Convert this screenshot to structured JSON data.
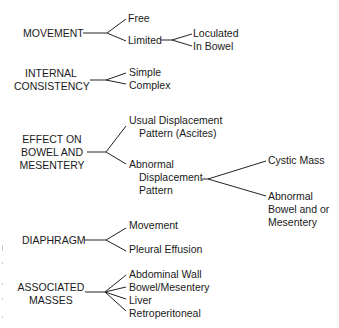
{
  "diagram": {
    "categories": [
      {
        "label": "MOVEMENT",
        "branches": [
          {
            "label": "Free"
          },
          {
            "label": "Limited",
            "branches": [
              {
                "label": "Loculated"
              },
              {
                "label": "In Bowel"
              }
            ]
          }
        ]
      },
      {
        "label_lines": [
          "INTERNAL",
          "CONSISTENCY"
        ],
        "branches": [
          {
            "label": "Simple"
          },
          {
            "label": "Complex"
          }
        ]
      },
      {
        "label_lines": [
          "EFFECT ON",
          "BOWEL AND",
          "MESENTERY"
        ],
        "branches": [
          {
            "label_lines": [
              "Usual Displacement",
              "Pattern (Ascites)"
            ]
          },
          {
            "label_lines": [
              "Abnormal",
              "Displacement",
              "Pattern"
            ],
            "branches": [
              {
                "label": "Cystic Mass"
              },
              {
                "label_lines": [
                  "Abnormal",
                  "Bowel and or",
                  "Mesentery"
                ]
              }
            ]
          }
        ]
      },
      {
        "label": "DIAPHRAGM",
        "branches": [
          {
            "label": "Movement"
          },
          {
            "label": "Pleural Effusion"
          }
        ]
      },
      {
        "label_lines": [
          "ASSOCIATED",
          "MASSES"
        ],
        "branches": [
          {
            "label": "Abdominal Wall"
          },
          {
            "label": "Bowel/Mesentery"
          },
          {
            "label": "Liver"
          },
          {
            "label": "Retroperitoneal"
          }
        ]
      }
    ]
  }
}
